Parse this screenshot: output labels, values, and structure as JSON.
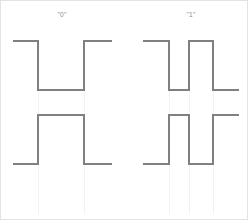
{
  "figure": {
    "background": "#ffffff",
    "border_color": "#e3e3e3",
    "line_color": "#808080",
    "guide_color": "#f2f2f2",
    "label_color": "#8a8a8a",
    "width": 248,
    "height": 220
  },
  "labels": {
    "left": "\"0\"",
    "right": "\"1\""
  },
  "chart_data": {
    "type": "line",
    "title": "",
    "xlabel": "",
    "ylabel": "",
    "grid": false,
    "legend": "none",
    "levels": {
      "top_high_y": 40,
      "top_low_y": 89,
      "bottom_high_y": 114,
      "bottom_low_y": 163
    },
    "series": [
      {
        "name": "bit-0-top",
        "cell": "left",
        "row": "top",
        "points": [
          [
            12,
            40
          ],
          [
            37,
            40
          ],
          [
            37,
            89
          ],
          [
            83,
            89
          ],
          [
            83,
            40
          ],
          [
            111,
            40
          ]
        ]
      },
      {
        "name": "bit-0-bottom",
        "cell": "left",
        "row": "bottom",
        "points": [
          [
            12,
            163
          ],
          [
            37,
            163
          ],
          [
            37,
            114
          ],
          [
            83,
            114
          ],
          [
            83,
            163
          ],
          [
            111,
            163
          ]
        ]
      },
      {
        "name": "bit-1-top",
        "cell": "right",
        "row": "top",
        "points": [
          [
            142,
            40
          ],
          [
            168,
            40
          ],
          [
            168,
            89
          ],
          [
            188,
            89
          ],
          [
            188,
            40
          ],
          [
            212,
            40
          ],
          [
            212,
            89
          ],
          [
            238,
            89
          ]
        ]
      },
      {
        "name": "bit-1-bottom",
        "cell": "right",
        "row": "bottom",
        "points": [
          [
            142,
            163
          ],
          [
            168,
            163
          ],
          [
            168,
            114
          ],
          [
            188,
            114
          ],
          [
            188,
            163
          ],
          [
            212,
            163
          ],
          [
            212,
            114
          ],
          [
            238,
            114
          ]
        ]
      }
    ],
    "guides": [
      {
        "name": "guide-left-a",
        "x": 37,
        "y1": 89,
        "y2": 213
      },
      {
        "name": "guide-left-b",
        "x": 83,
        "y1": 89,
        "y2": 213
      },
      {
        "name": "guide-right-a",
        "x": 168,
        "y1": 89,
        "y2": 213
      },
      {
        "name": "guide-right-b",
        "x": 188,
        "y1": 89,
        "y2": 213
      },
      {
        "name": "guide-right-c",
        "x": 212,
        "y1": 89,
        "y2": 213
      }
    ],
    "label_positions": [
      {
        "key": "left",
        "x": 61,
        "y": 14
      },
      {
        "key": "right",
        "x": 190,
        "y": 14
      }
    ]
  }
}
